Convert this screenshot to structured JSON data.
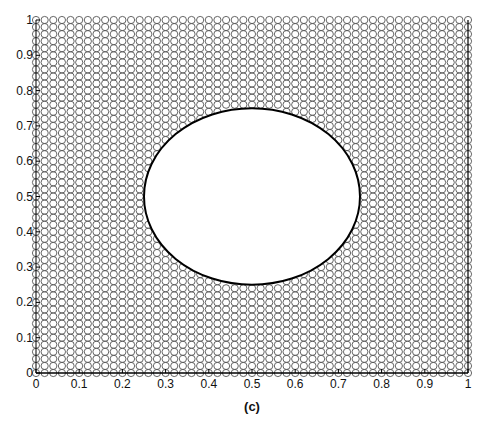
{
  "chart_data": {
    "type": "scatter",
    "title": "",
    "caption": "(c)",
    "xlabel": "",
    "ylabel": "",
    "xlim": [
      0,
      1
    ],
    "ylim": [
      0,
      1
    ],
    "grid": false,
    "legend": null,
    "xticks": [
      "0",
      "0.1",
      "0.2",
      "0.3",
      "0.4",
      "0.5",
      "0.6",
      "0.7",
      "0.8",
      "0.9",
      "1"
    ],
    "yticks": [
      "0",
      "0.1",
      "0.2",
      "0.3",
      "0.4",
      "0.5",
      "0.6",
      "0.7",
      "0.8",
      "0.9",
      "1"
    ],
    "series": [
      {
        "name": "grid points",
        "marker": "open-circle",
        "color": "#555555",
        "grid": {
          "x_start": 0,
          "x_end": 1,
          "y_start": 0,
          "y_end": 1,
          "step": 0.02
        },
        "excluded_region": {
          "shape": "circle",
          "center": [
            0.5,
            0.5
          ],
          "radius": 0.25
        }
      },
      {
        "name": "boundary",
        "type": "line",
        "color": "#000000",
        "shape": "circle",
        "center": [
          0.5,
          0.5
        ],
        "radius": 0.25
      }
    ]
  }
}
